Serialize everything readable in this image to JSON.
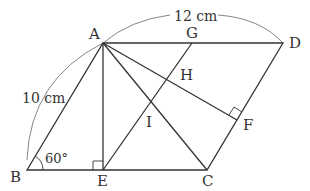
{
  "diagram": {
    "type": "geometry",
    "points": {
      "A": {
        "label": "A",
        "x": 103,
        "y": 43
      },
      "B": {
        "label": "B",
        "x": 27,
        "y": 170
      },
      "C": {
        "label": "C",
        "x": 207,
        "y": 170
      },
      "D": {
        "label": "D",
        "x": 283,
        "y": 43
      },
      "E": {
        "label": "E",
        "x": 103,
        "y": 170
      },
      "F": {
        "label": "F",
        "x": 237,
        "y": 120
      },
      "G": {
        "label": "G",
        "x": 192,
        "y": 43
      },
      "H": {
        "label": "H",
        "x": 168,
        "y": 79
      },
      "I": {
        "label": "I",
        "x": 151,
        "y": 102
      }
    },
    "dimensions": {
      "AB": "10 cm",
      "AD": "12 cm"
    },
    "angle": {
      "vertex": "B",
      "value": "60°"
    },
    "right_angles": [
      "E",
      "F"
    ],
    "segments": [
      "AB",
      "BC",
      "CD",
      "DA",
      "AE",
      "AC",
      "AF",
      "EG"
    ]
  }
}
